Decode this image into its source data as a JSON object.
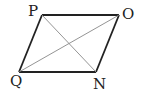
{
  "diagram": {
    "type": "parallelogram",
    "stroke_color": "#222222",
    "diagonal_color": "#888888",
    "vertices": [
      {
        "label": "P",
        "x": 42,
        "y": 15
      },
      {
        "label": "O",
        "x": 119,
        "y": 15
      },
      {
        "label": "N",
        "x": 96,
        "y": 72
      },
      {
        "label": "Q",
        "x": 19,
        "y": 72
      }
    ],
    "edges": [
      [
        "P",
        "O"
      ],
      [
        "O",
        "N"
      ],
      [
        "N",
        "Q"
      ],
      [
        "Q",
        "P"
      ]
    ],
    "diagonals": [
      [
        "P",
        "N"
      ],
      [
        "Q",
        "O"
      ]
    ]
  }
}
